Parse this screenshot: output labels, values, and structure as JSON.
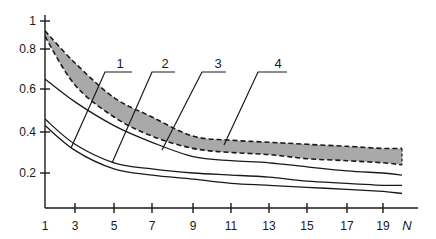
{
  "chart_data": {
    "type": "line",
    "title": "",
    "xlabel": "N",
    "ylabel": "",
    "x_ticks": [
      1,
      3,
      5,
      7,
      9,
      11,
      13,
      15,
      17,
      19
    ],
    "y_ticks": [
      0.2,
      0.4,
      0.6,
      0.8,
      1
    ],
    "ylim": [
      0.05,
      1
    ],
    "xlim": [
      1,
      21
    ],
    "grid": false,
    "legend": "none (curves numbered with leader-line callouts 1-4)",
    "x": [
      1,
      3,
      5,
      7,
      9,
      11,
      13,
      15,
      17,
      19,
      20
    ],
    "series": [
      {
        "name": "1",
        "style": "solid",
        "values": [
          0.43,
          0.31,
          0.22,
          0.19,
          0.17,
          0.15,
          0.14,
          0.13,
          0.12,
          0.11,
          0.1
        ]
      },
      {
        "name": "2",
        "style": "solid",
        "values": [
          0.46,
          0.34,
          0.25,
          0.22,
          0.2,
          0.19,
          0.18,
          0.16,
          0.15,
          0.14,
          0.14
        ]
      },
      {
        "name": "3",
        "style": "solid",
        "values": [
          0.65,
          0.54,
          0.43,
          0.35,
          0.28,
          0.26,
          0.25,
          0.23,
          0.21,
          0.2,
          0.19
        ]
      },
      {
        "name": "4 (upper bound)",
        "style": "dashed",
        "values": [
          0.93,
          0.73,
          0.56,
          0.47,
          0.38,
          0.36,
          0.35,
          0.34,
          0.33,
          0.32,
          0.32
        ]
      },
      {
        "name": "4 (lower bound)",
        "style": "dashed",
        "values": [
          0.89,
          0.62,
          0.47,
          0.38,
          0.32,
          0.3,
          0.29,
          0.27,
          0.26,
          0.25,
          0.24
        ]
      }
    ],
    "band": {
      "name": "4",
      "fill": "#a9a9a9",
      "between": [
        "4 (upper bound)",
        "4 (lower bound)"
      ]
    },
    "annotations": [
      "1",
      "2",
      "3",
      "4"
    ]
  },
  "axes": {
    "x_label": "N",
    "x_tick_labels": [
      "1",
      "3",
      "5",
      "7",
      "9",
      "11",
      "13",
      "15",
      "17",
      "19"
    ],
    "y_tick_labels": [
      "1",
      "0.8",
      "0.6",
      "0.4",
      "0.2"
    ]
  },
  "callouts": [
    "1",
    "2",
    "3",
    "4"
  ],
  "colors": {
    "line": "#1a1a1a",
    "band_fill": "#a9a9a9",
    "background": "#ffffff"
  }
}
